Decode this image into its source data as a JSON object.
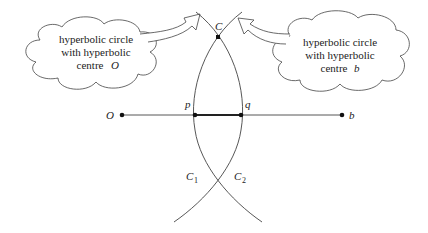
{
  "diagram": {
    "type": "hyperbolic geometry construction",
    "callouts": {
      "left": {
        "line1": "hyperbolic circle",
        "line2": "with hyperbolic",
        "line3": "centre",
        "centre_label": "O"
      },
      "right": {
        "line1": "hyperbolic circle",
        "line2": "with hyperbolic",
        "line3": "centre",
        "centre_label": "b"
      }
    },
    "points": {
      "O": "O",
      "b": "b",
      "p": "p",
      "q": "q",
      "C": "C"
    },
    "curves": {
      "C1": {
        "name": "C",
        "sub": "1"
      },
      "C2": {
        "name": "C",
        "sub": "2"
      }
    },
    "colors": {
      "stroke": "#333333",
      "point": "#111111",
      "background": "#ffffff"
    }
  }
}
